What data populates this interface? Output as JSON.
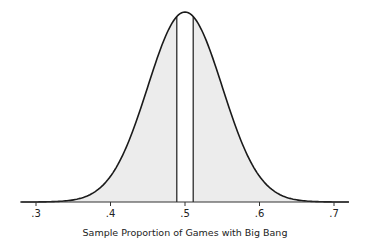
{
  "chart_data": {
    "type": "area",
    "title": "",
    "xlabel": "Sample Proportion of Games with Big Bang",
    "ylabel": "",
    "x_ticks": [
      ".3",
      ".4",
      ".5",
      ".6",
      ".7"
    ],
    "xlim": [
      0.28,
      0.72
    ],
    "distribution": {
      "kind": "normal",
      "mean": 0.5,
      "sd": 0.05
    },
    "shaded_regions": [
      {
        "from": 0.28,
        "to": 0.489,
        "fill": "#ececec"
      },
      {
        "from": 0.511,
        "to": 0.72,
        "fill": "#ececec"
      }
    ],
    "unshaded_region": {
      "from": 0.489,
      "to": 0.511
    },
    "vertical_lines": [
      0.489,
      0.511
    ],
    "grid": false,
    "legend": null
  },
  "colors": {
    "curve": "#1a1a1a",
    "fill": "#ececec",
    "axis": "#333333"
  }
}
